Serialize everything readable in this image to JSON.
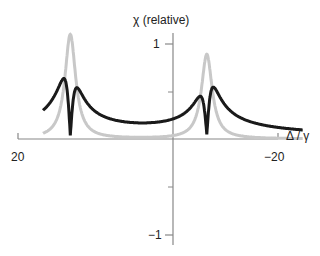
{
  "chart_data": {
    "type": "line",
    "title": "",
    "xlabel": "Δ / γ",
    "ylabel": "χ (relative)",
    "x_ticks": [
      {
        "value": 20,
        "label": "20"
      },
      {
        "value": -20,
        "label": "−20"
      }
    ],
    "y_ticks": [
      {
        "value": 1,
        "label": "1"
      },
      {
        "value": -1,
        "label": "−1"
      }
    ],
    "xlim": [
      20,
      -20
    ],
    "ylim": [
      -1.1,
      1.1
    ],
    "x_reversed": true,
    "grid": false,
    "legend": "none",
    "series": [
      {
        "name": "absorptive (imaginary part)",
        "color": "#c8c8c8",
        "resonances": [
          {
            "center": 15.8,
            "peak": 1.1,
            "width": 1.0
          },
          {
            "center": -5.2,
            "peak": 0.89,
            "width": 1.0
          }
        ]
      },
      {
        "name": "dispersive (real part)",
        "color": "#1a1a1a",
        "resonances": [
          {
            "center": 15.8,
            "max": 0.6,
            "min": -0.5,
            "width": 1.0
          },
          {
            "center": -5.2,
            "max": 0.4,
            "min": -0.5,
            "width": 1.0
          }
        ]
      }
    ]
  }
}
